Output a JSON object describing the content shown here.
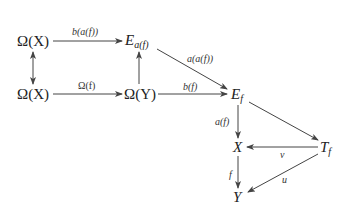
{
  "diagram": {
    "type": "commutative-diagram",
    "nodes": {
      "omega_x_top": {
        "text": "Ω(X)"
      },
      "e_af": {
        "base": "E",
        "sub": "a(f)"
      },
      "omega_x_bottom": {
        "text": "Ω(X)"
      },
      "omega_y": {
        "text": "Ω(Y)"
      },
      "e_f": {
        "base": "E",
        "sub": "f"
      },
      "x": {
        "text": "X"
      },
      "t_f": {
        "base": "T",
        "sub": "f"
      },
      "y": {
        "text": "Y"
      }
    },
    "edges": [
      {
        "from": "omega_x_top",
        "to": "e_af",
        "label": "b(a(f))"
      },
      {
        "from": "omega_x_top",
        "to": "omega_x_bottom",
        "label": "",
        "style": "double-headed"
      },
      {
        "from": "omega_x_bottom",
        "to": "omega_y",
        "label": "Ω(f)"
      },
      {
        "from": "omega_y",
        "to": "e_af",
        "label": ""
      },
      {
        "from": "e_af",
        "to": "e_f",
        "label": "a(a(f))"
      },
      {
        "from": "omega_y",
        "to": "e_f",
        "label": "b(f)"
      },
      {
        "from": "e_f",
        "to": "x",
        "label": "a(f)"
      },
      {
        "from": "e_f",
        "to": "t_f",
        "label": ""
      },
      {
        "from": "t_f",
        "to": "x",
        "label": "v"
      },
      {
        "from": "x",
        "to": "y",
        "label": "f"
      },
      {
        "from": "t_f",
        "to": "y",
        "label": "u"
      }
    ]
  }
}
